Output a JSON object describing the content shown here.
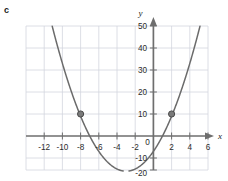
{
  "part_label": "c",
  "colors": {
    "grid": "#d3d6de",
    "axis": "#6e6e6e",
    "curve": "#6b6b6b",
    "point": "#7a7a7a",
    "point_stroke": "#4a4a4a",
    "text": "#2b2b2b",
    "background": "#ffffff"
  },
  "chart_data": {
    "type": "line",
    "title": "",
    "xlabel": "x",
    "ylabel": "y",
    "xlim": [
      -13,
      7
    ],
    "ylim": [
      -20,
      55
    ],
    "grid": true,
    "legend": "none",
    "x_ticks": [
      -12,
      -10,
      -8,
      -6,
      -4,
      -2,
      0,
      2,
      4,
      6
    ],
    "x_tick_labels": [
      "-12",
      "-10",
      "-8",
      "-6",
      "-4",
      "-2",
      "0",
      "2",
      "4",
      "6"
    ],
    "y_ticks": [
      -20,
      -10,
      0,
      10,
      20,
      30,
      40,
      50
    ],
    "y_tick_labels": [
      "-20",
      "-10",
      "0",
      "10",
      "20",
      "30",
      "40",
      "50"
    ],
    "y_tick_labels_drawn": [
      "50",
      "40",
      "30",
      "20",
      "10",
      "0",
      "-10",
      "-20"
    ],
    "series": [
      {
        "name": "parabola",
        "type": "curve",
        "equation": "y = x^2 + 6x - 7",
        "vertex": [
          -3,
          -16
        ],
        "roots": [
          -7,
          1
        ],
        "x": [
          -12.6,
          -12,
          -11,
          -10,
          -9,
          -8,
          -7,
          -6,
          -5,
          -4,
          -3,
          -2,
          -1,
          0,
          1,
          2,
          3,
          4,
          5,
          6,
          6.4
        ],
        "y": [
          58.2,
          53,
          48,
          33,
          20,
          9,
          0,
          -7,
          -12,
          -15,
          -16,
          -15,
          -12,
          -7,
          0,
          9,
          20,
          33,
          48,
          65,
          72
        ]
      }
    ],
    "points": [
      {
        "label": "",
        "x": -8,
        "y": 10
      },
      {
        "label": "",
        "x": 2,
        "y": 10
      }
    ]
  }
}
